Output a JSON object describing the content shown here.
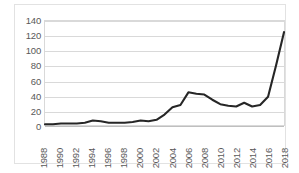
{
  "chart_data": {
    "type": "line",
    "title": "",
    "subtitle": "",
    "xlabel": "",
    "ylabel": "",
    "grid": true,
    "legend": false,
    "legend_position": "none",
    "line_color": "#262626",
    "gridline_color": "#d9d9d9",
    "tick_label_color": "#595959",
    "plot_background": "#ffffff",
    "xlim": [
      1988,
      2018
    ],
    "ylim": [
      0,
      140
    ],
    "yticks": [
      0,
      20,
      40,
      60,
      80,
      100,
      120,
      140
    ],
    "xticks": [
      "1988",
      "1990",
      "1992",
      "1994",
      "1996",
      "1998",
      "2000",
      "2002",
      "2004",
      "2006",
      "2008",
      "2010",
      "2012",
      "2014",
      "2016",
      "2018"
    ],
    "x": [
      1988,
      1989,
      1990,
      1991,
      1992,
      1993,
      1994,
      1995,
      1996,
      1997,
      1998,
      1999,
      2000,
      2001,
      2002,
      2003,
      2004,
      2005,
      2006,
      2007,
      2008,
      2009,
      2010,
      2011,
      2012,
      2013,
      2014,
      2015,
      2016,
      2017,
      2018
    ],
    "values": [
      1,
      1,
      2,
      2,
      2,
      3,
      6,
      5,
      3,
      3,
      3,
      4,
      6,
      5,
      7,
      14,
      24,
      27,
      44,
      42,
      41,
      34,
      28,
      26,
      25,
      30,
      25,
      27,
      38,
      80,
      125
    ],
    "series": [
      {
        "name": "series-1",
        "color": "#262626",
        "values": [
          1,
          1,
          2,
          2,
          2,
          3,
          6,
          5,
          3,
          3,
          3,
          4,
          6,
          5,
          7,
          14,
          24,
          27,
          44,
          42,
          41,
          34,
          28,
          26,
          25,
          30,
          25,
          27,
          38,
          80,
          125
        ]
      }
    ]
  }
}
